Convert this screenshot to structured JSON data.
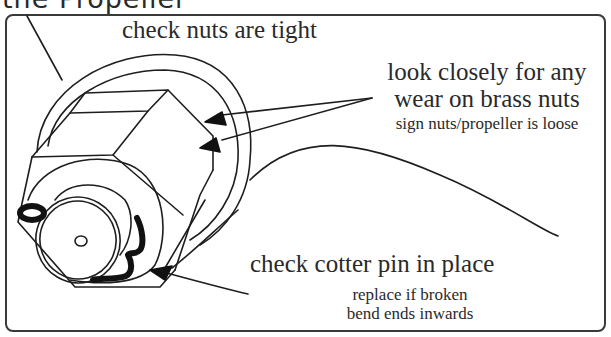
{
  "header": {
    "partial_title": "the Propeller"
  },
  "diagram": {
    "labels": {
      "nuts_tight": "check nuts are tight",
      "wear_line1": "look closely for any",
      "wear_line2": "wear on brass nuts",
      "wear_note": "sign nuts/propeller is loose",
      "cotter_pin": "check cotter pin in place",
      "cotter_note1": "replace if broken",
      "cotter_note2": "bend ends inwards"
    },
    "icons": [
      "arrow-icon",
      "arrow-icon",
      "arrow-icon"
    ],
    "colors": {
      "line": "#1e1e1e",
      "background": "#ffffff"
    }
  }
}
